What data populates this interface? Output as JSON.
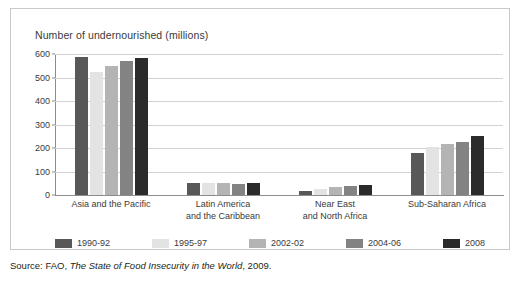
{
  "chart_data": {
    "type": "bar",
    "title": "Number of undernourished (millions)",
    "xlabel": "",
    "ylabel": "",
    "ylim": [
      0,
      600
    ],
    "yticks": [
      0,
      100,
      200,
      300,
      400,
      500,
      600
    ],
    "grid": true,
    "legend_position": "bottom",
    "categories": [
      "Asia and the Pacific",
      "Latin America\nand the Caribbean",
      "Near East\nand North Africa",
      "Sub-Saharan Africa"
    ],
    "category_lines": [
      [
        "Asia and the Pacific"
      ],
      [
        "Latin America",
        "and the Caribbean"
      ],
      [
        "Near East",
        "and North Africa"
      ],
      [
        "Sub-Saharan Africa"
      ]
    ],
    "series": [
      {
        "name": "1990-92",
        "color": "#585858",
        "values": [
          587,
          53,
          19,
          180
        ]
      },
      {
        "name": "1995-97",
        "color": "#e3e3e3",
        "values": [
          525,
          53,
          25,
          205
        ]
      },
      {
        "name": "2002-02",
        "color": "#b4b4b4",
        "values": [
          551,
          50,
          32,
          215
        ]
      },
      {
        "name": "2004-06",
        "color": "#838383",
        "values": [
          570,
          45,
          37,
          225
        ]
      },
      {
        "name": "2008",
        "color": "#2b2b2b",
        "values": [
          583,
          53,
          42,
          250
        ]
      }
    ]
  },
  "source": {
    "prefix": "Source: FAO, ",
    "title": "The State of Food Insecurity in the World",
    "suffix": ", 2009."
  }
}
